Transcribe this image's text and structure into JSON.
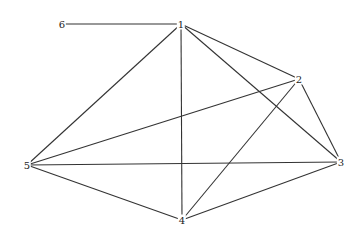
{
  "diagram": {
    "type": "graph",
    "nodes": [
      {
        "id": "1",
        "label": "1",
        "x": 181,
        "y": 24
      },
      {
        "id": "2",
        "label": "2",
        "x": 299,
        "y": 79
      },
      {
        "id": "3",
        "label": "3",
        "x": 341,
        "y": 162
      },
      {
        "id": "4",
        "label": "4",
        "x": 182,
        "y": 220
      },
      {
        "id": "5",
        "label": "5",
        "x": 27,
        "y": 165
      },
      {
        "id": "6",
        "label": "6",
        "x": 62,
        "y": 24
      }
    ],
    "edges": [
      [
        "6",
        "1"
      ],
      [
        "1",
        "2"
      ],
      [
        "1",
        "3"
      ],
      [
        "1",
        "4"
      ],
      [
        "1",
        "5"
      ],
      [
        "2",
        "3"
      ],
      [
        "2",
        "4"
      ],
      [
        "2",
        "5"
      ],
      [
        "3",
        "4"
      ],
      [
        "3",
        "5"
      ],
      [
        "4",
        "5"
      ]
    ]
  }
}
